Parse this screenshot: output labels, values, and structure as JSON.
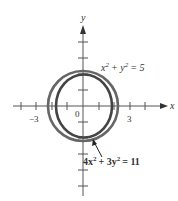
{
  "diagram": {
    "axes": {
      "x_label": "x",
      "y_label": "y",
      "origin_label": "0",
      "x_tick_labels": [
        {
          "value": -3,
          "text": "−3"
        },
        {
          "value": 3,
          "text": "3"
        }
      ],
      "x_range": [
        -4,
        4
      ],
      "y_range": [
        -5,
        5
      ]
    },
    "curves": [
      {
        "name": "circle",
        "equation_text": "x² + y² = 5",
        "lhs": "x",
        "mid": "+ y",
        "rhs": "= 5",
        "color": "#555555"
      },
      {
        "name": "ellipse",
        "equation_text": "4x² + 3y² = 11",
        "lhs": "4x",
        "mid": "+ 3y",
        "rhs": "= 11",
        "color": "#444444"
      }
    ],
    "exponent": "2"
  }
}
